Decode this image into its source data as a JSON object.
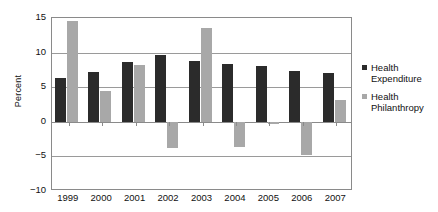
{
  "chart_data": {
    "type": "bar",
    "title": "",
    "subtitle": "",
    "xlabel": "",
    "ylabel": "Percent",
    "categories": [
      "1999",
      "2000",
      "2001",
      "2002",
      "2003",
      "2004",
      "2005",
      "2006",
      "2007"
    ],
    "series": [
      {
        "name": "Health Expenditure",
        "color": "#2b2b2b",
        "values": [
          6.3,
          7.2,
          8.7,
          9.6,
          8.8,
          8.3,
          8.0,
          7.3,
          7.1
        ]
      },
      {
        "name": "Health Philanthropy",
        "color": "#a8a8a8",
        "values": [
          14.6,
          4.5,
          8.2,
          -3.8,
          13.5,
          -3.6,
          -0.3,
          -4.8,
          3.2
        ]
      }
    ],
    "ylim": [
      -10,
      15
    ],
    "yticks": [
      15,
      10,
      5,
      0,
      -5,
      -10
    ],
    "ytick_labels": [
      "15",
      "10",
      "5",
      "0",
      "−5",
      "−10"
    ],
    "grid": true,
    "grid_axis": "y",
    "legend_position": "right",
    "bar_orientation": "vertical"
  },
  "legend": {
    "entries": [
      {
        "label_line1": "Health",
        "label_line2": "Expenditure",
        "swatch": "#2b2b2b"
      },
      {
        "label_line1": "Health",
        "label_line2": "Philanthropy",
        "swatch": "#a8a8a8"
      }
    ]
  },
  "icons": {
    "legend_marker_0": "square-marker-icon",
    "legend_marker_1": "square-marker-icon"
  }
}
